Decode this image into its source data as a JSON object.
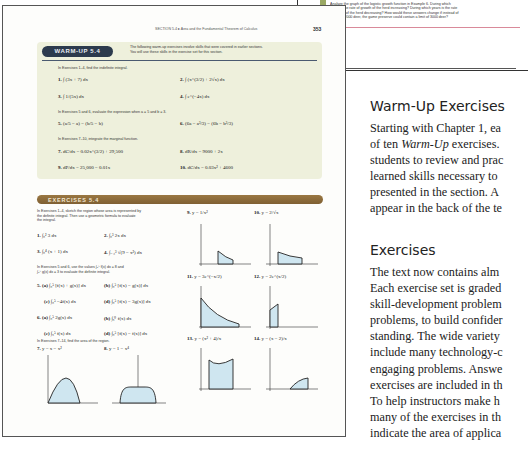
{
  "background_page": {
    "text_lines": [
      "Analyze the graph of the logistic growth function in Example 6. During which",
      "years is the rate of growth of the herd increasing? During which years is the rate",
      "of growth of the herd decreasing? How would these answers change if instead of",
      "a limit of 2000 deer, the game preserve could contain a limit of 3000 deer?"
    ]
  },
  "textbook_page": {
    "running_head": "SECTION 5.4  ▸  Area and the Fundamental Theorem of Calculus",
    "page_number": "353",
    "warm_up": {
      "badge": "WARM-UP 5.4",
      "intro": [
        "The following warm-up exercises involve skills that were covered in earlier sections.",
        "You will use these skills in the exercise set for this section."
      ],
      "instructions_1": "In Exercises 1–4, find the indefinite integral.",
      "problems_1": [
        {
          "num": "1.",
          "expr": "∫ (3x + 7) dx"
        },
        {
          "num": "2.",
          "expr": "∫ (x^(3/2) + 2√x) dx"
        },
        {
          "num": "3.",
          "expr": "∫ 1/(5x) dx"
        },
        {
          "num": "4.",
          "expr": "∫ e^(−4x) dx"
        }
      ],
      "instructions_2": "In Exercises 5 and 6, evaluate the expression when a = 5 and b = 3.",
      "problems_2": [
        {
          "num": "5.",
          "expr": "(a/5 − a) − (b/5 − b)"
        },
        {
          "num": "6.",
          "expr": "(6a − a³/3) − (6b − b³/3)"
        }
      ],
      "instructions_3": "In Exercises 7–10, integrate the marginal function.",
      "problems_3": [
        {
          "num": "7.",
          "expr": "dC/dx = 0.02x^(3/2) + 29,500"
        },
        {
          "num": "8.",
          "expr": "dR/dx = 9000 + 2x"
        },
        {
          "num": "9.",
          "expr": "dP/dx = 25,000 − 0.01x"
        },
        {
          "num": "10.",
          "expr": "dC/dx = 0.03x² + 4600"
        }
      ]
    },
    "exercises": {
      "title": "EXERCISES 5.4",
      "instructions_1": [
        "In Exercises 1–4, sketch the region whose area is represented by",
        "the definite integral. Then use a geometric formula to evaluate",
        "the integral."
      ],
      "problems_1": [
        {
          "num": "1.",
          "expr": "∫₀² 3 dx"
        },
        {
          "num": "2.",
          "expr": "∫₀³ 2x dx"
        },
        {
          "num": "3.",
          "expr": "∫₀⁴ (x + 1) dx"
        },
        {
          "num": "4.",
          "expr": "∫₋₃³ √(9 − x²) dx"
        }
      ],
      "instructions_2": [
        "In Exercises 5 and 6, use the values ∫₀⁵ f(x) dx = 8 and",
        "∫₀⁵ g(x) dx = 3 to evaluate the definite integral."
      ],
      "problems_2": [
        {
          "num": "5. (a)",
          "expr": "∫₀⁵ [f(x) + g(x)] dx"
        },
        {
          "num": "(b)",
          "expr": "∫₀⁵ [f(x) − g(x)] dx"
        },
        {
          "num": "(c)",
          "expr": "∫₀⁵ −4f(x) dx"
        },
        {
          "num": "(d)",
          "expr": "∫₀⁵ [f(x) − 3g(x)] dx"
        },
        {
          "num": "6. (a)",
          "expr": "∫₀⁵ 2g(x) dx"
        },
        {
          "num": "(b)",
          "expr": "∫₅⁰ f(x) dx"
        },
        {
          "num": "(c)",
          "expr": "∫₅⁵ f(x) dx"
        },
        {
          "num": "(d)",
          "expr": "∫₀⁵ [f(x) − f(x)] dx"
        }
      ],
      "instructions_3": "In Exercises 7–14, find the area of the region.",
      "graph_problems": [
        {
          "num": "7.",
          "expr": "y = x − x²"
        },
        {
          "num": "8.",
          "expr": "y = 1 − x⁴"
        },
        {
          "num": "9.",
          "expr": "y = 1/x²"
        },
        {
          "num": "10.",
          "expr": "y = 2/√x"
        },
        {
          "num": "11.",
          "expr": "y = 3e^(−x/2)"
        },
        {
          "num": "12.",
          "expr": "y = 2e^(x/2)"
        },
        {
          "num": "13.",
          "expr": "y = (x² + 4)/x"
        },
        {
          "num": "14.",
          "expr": "y = (x − 2)/x"
        }
      ]
    }
  },
  "right_column": {
    "warmup_heading": "Warm-Up Exercises",
    "warmup_lines": [
      "Starting with Chapter 1, ea",
      "of ten ",
      "Warm-Up",
      " exercises.",
      "students to review and prac",
      "learned skills necessary to",
      "presented in the section. A",
      "appear in the back of the te"
    ],
    "exercises_heading": "Exercises",
    "exercises_lines": [
      "The text now contains alm",
      "Each exercise set is graded",
      "skill-development problem",
      "problems, to build confider",
      "standing. The wide variety",
      "include many technology-c",
      "engaging problems. Answe",
      "exercises are included in th",
      "To help instructors make h",
      "many of the exercises in th",
      "indicate the area of applica"
    ]
  },
  "colors": {
    "warmup_panel": "#eef0dc",
    "warmup_badge": "#2c3a4d",
    "exercises_bar": "#8c6b3a",
    "graph_fill": "#cfe6f0",
    "accent_line": "#d98a9a"
  }
}
